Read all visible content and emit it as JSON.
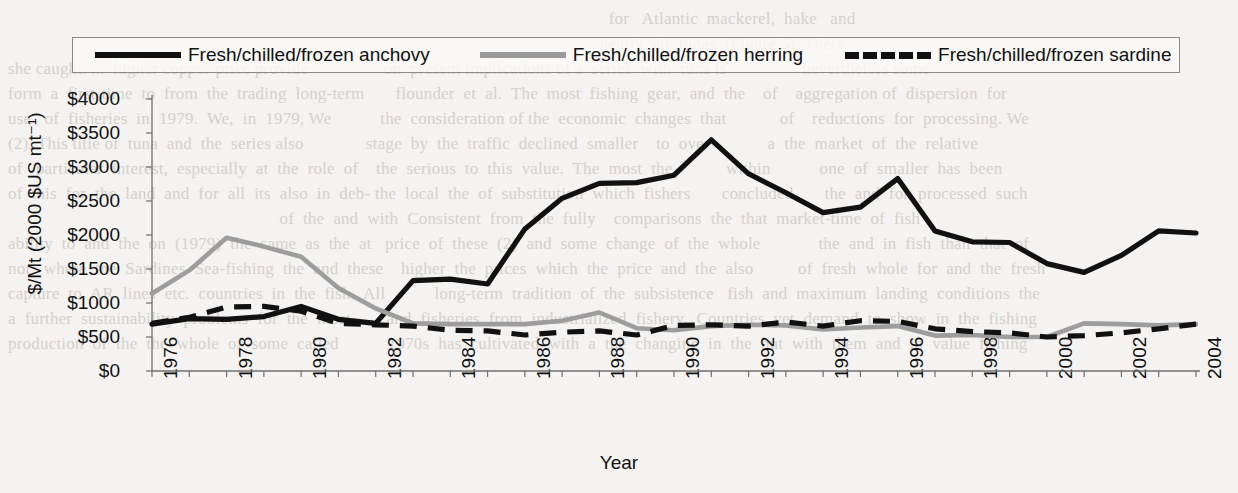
{
  "figure": {
    "background_color": "#f4f3f1",
    "line_colors": {
      "anchovy": "#111111",
      "herring": "#9d9d9d",
      "sardine": "#111111"
    }
  },
  "legend": {
    "items": [
      {
        "label": "Fresh/chilled/frozen anchovy",
        "style": "solid-dark"
      },
      {
        "label": "Fresh/chilled/frozen herring",
        "style": "solid-gray"
      },
      {
        "label": "Fresh/chilled/frozen sardine",
        "style": "dashed-dark"
      }
    ]
  },
  "axes": {
    "y_label": "$/Mt (2000 $US mt⁻¹)",
    "x_label": "Year",
    "y_ticks": [
      "$4000",
      "$3500",
      "$3000",
      "$2500",
      "$2000",
      "$1500",
      "$1000",
      "$500",
      "$0"
    ],
    "x_ticks": [
      "1976",
      "1978",
      "1980",
      "1982",
      "1984",
      "1986",
      "1988",
      "1990",
      "1992",
      "1994",
      "1996",
      "1998",
      "2000",
      "2002",
      "2004"
    ]
  },
  "chart_data": {
    "type": "line",
    "title": "",
    "xlabel": "Year",
    "ylabel": "$/Mt (2000 $US mt⁻¹)",
    "xlim": [
      1976,
      2004
    ],
    "ylim": [
      0,
      4000
    ],
    "ytick_values": [
      0,
      500,
      1000,
      1500,
      2000,
      2500,
      3000,
      3500,
      4000
    ],
    "xtick_values": [
      1976,
      1978,
      1980,
      1982,
      1984,
      1986,
      1988,
      1990,
      1992,
      1994,
      1996,
      1998,
      2000,
      2002,
      2004
    ],
    "grid": false,
    "legend_position": "top",
    "x": [
      1976,
      1977,
      1978,
      1979,
      1980,
      1981,
      1982,
      1983,
      1984,
      1985,
      1986,
      1987,
      1988,
      1989,
      1990,
      1991,
      1992,
      1993,
      1994,
      1995,
      1996,
      1997,
      1998,
      1999,
      2000,
      2001,
      2002,
      2003,
      2004
    ],
    "series": [
      {
        "name": "Fresh/chilled/frozen anchovy",
        "style": "solid",
        "color": "#111111",
        "values": [
          690,
          770,
          760,
          800,
          950,
          760,
          700,
          1330,
          1350,
          1280,
          2090,
          2540,
          2760,
          2770,
          2880,
          3400,
          2900,
          2620,
          2330,
          2410,
          2830,
          2060,
          1900,
          1890,
          1580,
          1450,
          1700,
          2060,
          2030
        ]
      },
      {
        "name": "Fresh/chilled/frozen herring",
        "style": "solid",
        "color": "#9d9d9d",
        "values": [
          1140,
          1480,
          1960,
          1830,
          1680,
          1220,
          920,
          700,
          690,
          690,
          690,
          740,
          860,
          630,
          600,
          660,
          680,
          670,
          610,
          640,
          660,
          520,
          530,
          500,
          500,
          700,
          690,
          670,
          690
        ]
      },
      {
        "name": "Fresh/chilled/frozen sardine",
        "style": "dashed",
        "color": "#111111",
        "values": [
          700,
          790,
          940,
          950,
          880,
          700,
          680,
          660,
          600,
          590,
          530,
          570,
          590,
          530,
          670,
          680,
          660,
          720,
          660,
          740,
          730,
          620,
          580,
          560,
          500,
          520,
          560,
          620,
          690
        ]
      }
    ]
  }
}
